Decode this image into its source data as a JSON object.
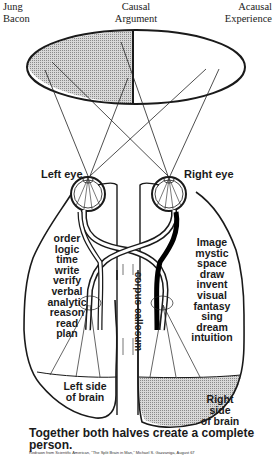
{
  "header": {
    "left": [
      "Jung",
      "Bacon"
    ],
    "center": [
      "Causal",
      "Argument"
    ],
    "right": [
      "Acausal",
      "Experience"
    ]
  },
  "eyes": {
    "left_label": "Left eye",
    "right_label": "Right eye"
  },
  "left_hemisphere": {
    "words": [
      "order",
      "logic",
      "time",
      "write",
      "verify",
      "verbal",
      "analytic",
      "reason",
      "read",
      "plan"
    ],
    "side_label": [
      "Left side",
      "of brain"
    ]
  },
  "right_hemisphere": {
    "words": [
      "Image",
      "mystic",
      "space",
      "draw",
      "invent",
      "visual",
      "fantasy",
      "sing",
      "dream",
      "intuition"
    ],
    "side_label": [
      "Right",
      "side",
      "of brain"
    ]
  },
  "corpus_callosum_label": "corpus callosum",
  "caption": "Together both halves create a complete person.",
  "citation": "Redrawn from Scientific American, \"The Split Brain in Man,\" Michael S. Gazzaniga, August 67",
  "colors": {
    "ink": "#1a1a1a",
    "shading": "#b8b8b8",
    "background": "#ffffff"
  }
}
